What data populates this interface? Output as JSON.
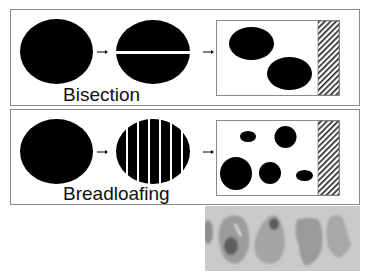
{
  "panels": [
    {
      "label": "Bisection"
    },
    {
      "label": "Breadloafing"
    }
  ],
  "photo": {
    "description": "specimen-tissue-slices"
  },
  "colors": {
    "shape": "#000000",
    "border": "#8a8a8a",
    "photo_bg": "#c9c9c9"
  }
}
